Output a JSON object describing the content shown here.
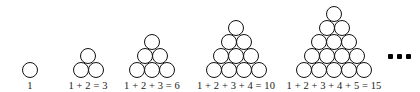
{
  "figure": {
    "stroke_color": "#111111",
    "fill_color": "#ffffff",
    "text_color": "#1a1a1a",
    "background": "#ffffff",
    "circle_diameter_px": 16,
    "ellipsis_glyph": "..."
  },
  "chart_data": {
    "type": "diagram",
    "groups": [
      {
        "index": 1,
        "rows": [
          1
        ],
        "row_count": 1,
        "total_circles": 1,
        "caption": "1",
        "addends": [
          1
        ],
        "sum": 1
      },
      {
        "index": 2,
        "rows": [
          1,
          2
        ],
        "row_count": 2,
        "total_circles": 3,
        "caption": "1 + 2 = 3",
        "addends": [
          1,
          2
        ],
        "sum": 3
      },
      {
        "index": 3,
        "rows": [
          1,
          2,
          3
        ],
        "row_count": 3,
        "total_circles": 6,
        "caption": "1 + 2 + 3 = 6",
        "addends": [
          1,
          2,
          3
        ],
        "sum": 6
      },
      {
        "index": 4,
        "rows": [
          1,
          2,
          3,
          4
        ],
        "row_count": 4,
        "total_circles": 10,
        "caption": "1 + 2 + 3 + 4 = 10",
        "addends": [
          1,
          2,
          3,
          4
        ],
        "sum": 10
      },
      {
        "index": 5,
        "rows": [
          1,
          2,
          3,
          4,
          5
        ],
        "row_count": 5,
        "total_circles": 15,
        "caption": "1 + 2 + 3 + 4 + 5 = 15",
        "addends": [
          1,
          2,
          3,
          4,
          5
        ],
        "sum": 15
      }
    ],
    "continuation": "..."
  },
  "layout": {
    "group_left_px": [
      22,
      72,
      126,
      200,
      292
    ],
    "group_width_px": [
      16,
      32,
      48,
      64,
      80
    ]
  }
}
